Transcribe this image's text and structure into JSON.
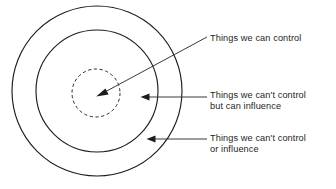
{
  "diagram": {
    "type": "concentric-circle-diagram",
    "background_color": "#ffffff",
    "stroke_color": "#1d1d1d",
    "text_color": "#1e1e1e",
    "rings": [
      {
        "id": "outer",
        "name": "things-we-cant-control-or-influence",
        "style": "solid",
        "center": {
          "x": 97,
          "y": 91
        },
        "radius": 85
      },
      {
        "id": "middle",
        "name": "things-we-cant-control-but-can-influence",
        "style": "solid",
        "center": {
          "x": 97,
          "y": 91
        },
        "radius": 61
      },
      {
        "id": "inner",
        "name": "things-we-can-control",
        "style": "dashed",
        "center": {
          "x": 96,
          "y": 93
        },
        "radius": 24
      }
    ],
    "labels": {
      "control": "Things we can control",
      "influence_line1": "Things we can't control",
      "influence_line2": "but can influence",
      "neither_line1": "Things we can't control",
      "neither_line2": "or influence"
    },
    "callouts": [
      {
        "id": "callout-control",
        "target_ring": "inner",
        "orientation": "diagonal",
        "from": {
          "x": 207,
          "y": 37
        },
        "to": {
          "x": 97,
          "y": 96
        }
      },
      {
        "id": "callout-influence",
        "target_ring": "middle",
        "orientation": "horizontal",
        "from": {
          "x": 207,
          "y": 97
        },
        "to": {
          "x": 141,
          "y": 97
        }
      },
      {
        "id": "callout-neither",
        "target_ring": "outer",
        "orientation": "horizontal",
        "from": {
          "x": 207,
          "y": 139
        },
        "to": {
          "x": 147,
          "y": 139
        }
      }
    ]
  }
}
